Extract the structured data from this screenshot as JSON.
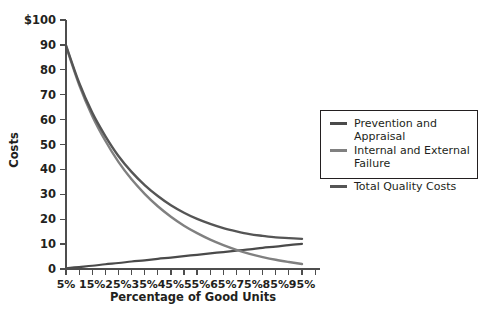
{
  "chart_data": {
    "type": "line",
    "title": "",
    "xlabel": "Percentage of Good Units",
    "ylabel": "Costs",
    "xlim": [
      5,
      95
    ],
    "ylim": [
      0,
      100
    ],
    "grid": false,
    "legend_position": "right",
    "x": [
      5,
      10,
      15,
      20,
      25,
      30,
      35,
      40,
      45,
      50,
      55,
      60,
      65,
      70,
      75,
      80,
      85,
      90,
      95
    ],
    "x_tick_labels": [
      "5%",
      "15%",
      "25%",
      "35%",
      "45%",
      "55%",
      "65%",
      "75%",
      "85%",
      "95%"
    ],
    "x_tick_values": [
      5,
      15,
      25,
      35,
      45,
      55,
      65,
      75,
      85,
      95
    ],
    "x_minor_tick_values": [
      10,
      20,
      30,
      40,
      50,
      60,
      70,
      80,
      90
    ],
    "y_tick_labels": [
      "0",
      "10",
      "20",
      "30",
      "40",
      "50",
      "60",
      "70",
      "80",
      "90",
      "$100"
    ],
    "y_tick_values": [
      0,
      10,
      20,
      30,
      40,
      50,
      60,
      70,
      80,
      90,
      100
    ],
    "series": [
      {
        "name": "Prevention and Appraisal",
        "color": "#4a4a4a",
        "width": 2.2,
        "values": [
          0.3,
          0.8,
          1.3,
          1.9,
          2.4,
          3.0,
          3.5,
          4.1,
          4.6,
          5.2,
          5.7,
          6.3,
          6.8,
          7.4,
          7.9,
          8.5,
          9.0,
          9.6,
          10.1
        ]
      },
      {
        "name": "Internal and External Failure",
        "color": "#808080",
        "width": 2.4,
        "values": [
          89.5,
          74.0,
          61.5,
          51.5,
          43.0,
          36.0,
          30.2,
          25.2,
          21.0,
          17.4,
          14.4,
          11.8,
          9.6,
          7.7,
          6.1,
          4.8,
          3.7,
          2.8,
          2.0
        ]
      },
      {
        "name": "Total Quality Costs",
        "color": "#555555",
        "width": 2.4,
        "values": [
          89.8,
          74.8,
          62.8,
          53.4,
          45.4,
          39.0,
          33.7,
          29.3,
          25.6,
          22.6,
          20.1,
          18.1,
          16.4,
          15.1,
          14.0,
          13.3,
          12.7,
          12.4,
          12.1
        ]
      }
    ],
    "legend": [
      {
        "label": "Prevention and Appraisal",
        "color": "#4a4a4a"
      },
      {
        "label": "Internal and External\nFailure",
        "color": "#808080"
      },
      {
        "label": "Total Quality Costs",
        "color": "#555555"
      }
    ]
  }
}
